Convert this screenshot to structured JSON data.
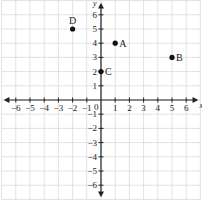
{
  "diagram": {
    "title": "",
    "type": "coordinate-plane",
    "x_axis": {
      "label": "x",
      "min": -6,
      "max": 6,
      "ticks": [
        "-6",
        "-5",
        "-4",
        "-3",
        "-2",
        "-1",
        "0",
        "1",
        "2",
        "3",
        "4",
        "5",
        "6"
      ]
    },
    "y_axis": {
      "label": "y",
      "min": -6,
      "max": 6,
      "ticks": [
        "-6",
        "-5",
        "-4",
        "-3",
        "-2",
        "-1",
        "1",
        "2",
        "3",
        "4",
        "5",
        "6"
      ]
    },
    "origin_label": "0",
    "grid": true,
    "colors": {
      "grid": "#d9d9d9",
      "axis": "#222222",
      "point": "#111111",
      "text": "#222222",
      "background": "#ffffff"
    },
    "points": [
      {
        "label": "A",
        "x": 1,
        "y": 4,
        "label_pos": "right"
      },
      {
        "label": "B",
        "x": 5,
        "y": 3,
        "label_pos": "right"
      },
      {
        "label": "C",
        "x": 0,
        "y": 2,
        "label_pos": "right"
      },
      {
        "label": "D",
        "x": -2,
        "y": 5,
        "label_pos": "above"
      }
    ]
  },
  "chart_data": {
    "type": "scatter",
    "title": "",
    "xlabel": "x",
    "ylabel": "y",
    "xlim": [
      -6,
      6
    ],
    "ylim": [
      -6,
      6
    ],
    "grid": true,
    "series": [
      {
        "name": "points",
        "labels": [
          "A",
          "B",
          "C",
          "D"
        ],
        "x": [
          1,
          5,
          0,
          -2
        ],
        "y": [
          4,
          3,
          2,
          5
        ]
      }
    ]
  }
}
